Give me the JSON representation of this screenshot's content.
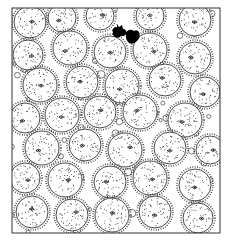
{
  "illustration": {
    "subject": "Pen-and-ink hidden-object illustration of densely packed spiky pufferfish with a small black creature near the top",
    "frame": {
      "x": 12,
      "y": 8,
      "width": 208,
      "height": 225,
      "stroke": "#333333"
    },
    "colors": {
      "ink": "#1a1a1a",
      "paper": "#ffffff",
      "silhouette": "#000000"
    },
    "hidden_figure": {
      "name": "black-creature-silhouette",
      "x": 120,
      "y": 30
    }
  }
}
